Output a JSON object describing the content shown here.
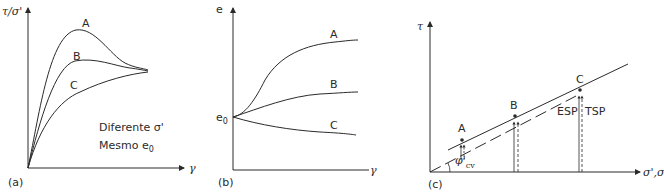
{
  "panels": {
    "a": {
      "tag": "(a)",
      "ylabel": "τ/σ'",
      "xlabel": "γ",
      "curves": [
        {
          "name": "A",
          "label": "A"
        },
        {
          "name": "B",
          "label": "B"
        },
        {
          "name": "C",
          "label": "C"
        }
      ],
      "note_line1": "Diferente σ'",
      "note_line2_prefix": "Mesmo e",
      "note_line2_sub": "0"
    },
    "b": {
      "tag": "(b)",
      "ylabel": "e",
      "xlabel": "γ",
      "origin_label": "e",
      "origin_sub": "0",
      "curves": [
        {
          "name": "A",
          "label": "A"
        },
        {
          "name": "B",
          "label": "B"
        },
        {
          "name": "C",
          "label": "C"
        }
      ]
    },
    "c": {
      "tag": "(c)",
      "ylabel": "τ",
      "xlabel": "σ',σ",
      "points": [
        {
          "name": "A",
          "label": "A"
        },
        {
          "name": "B",
          "label": "B"
        },
        {
          "name": "C",
          "label": "C"
        }
      ],
      "esp_label": "ESP",
      "tsp_label": "TSP",
      "angle_label": "φ'",
      "angle_sub": "cv"
    }
  },
  "colors": {
    "line": "#2a2a2a",
    "background": "#ffffff"
  }
}
